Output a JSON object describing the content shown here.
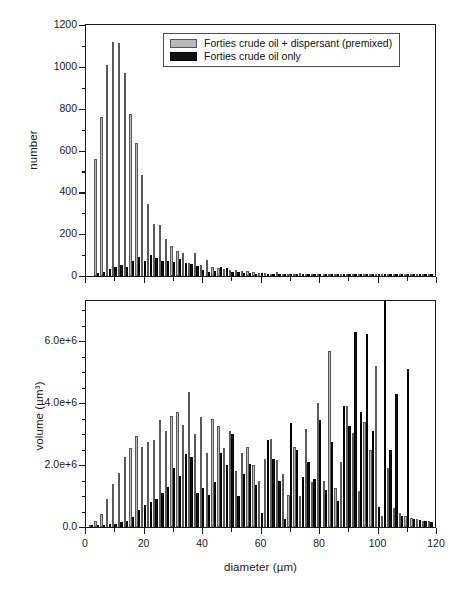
{
  "figure": {
    "background": "#ffffff",
    "series_colors": {
      "gray": "#b9b9b9",
      "black": "#111111"
    }
  },
  "legend": {
    "entries": [
      {
        "swatch": "gray",
        "label": "Forties crude oil + dispersant (premixed)"
      },
      {
        "swatch": "black",
        "label": "Forties crude oil only"
      }
    ]
  },
  "axes": {
    "x_label": "diameter (µm)",
    "x_ticks": [
      "0",
      "20",
      "40",
      "60",
      "80",
      "100",
      "120"
    ],
    "top_y_label": "number",
    "top_y_ticks": [
      "0",
      "200",
      "400",
      "600",
      "800",
      "1000",
      "1200"
    ],
    "bottom_y_label": "volume (µm³)",
    "bottom_y_ticks": [
      "0.0",
      "2.0e+6",
      "4.0e+6",
      "6.0e+6"
    ]
  },
  "chart_data": [
    {
      "type": "bar",
      "id": "number-panel",
      "title": "",
      "xlabel": "diameter (µm)",
      "ylabel": "number",
      "xlim": [
        0,
        120
      ],
      "ylim": [
        0,
        1200
      ],
      "grid": false,
      "legend_position": "top-right",
      "x": [
        2,
        4,
        6,
        8,
        10,
        12,
        14,
        16,
        18,
        20,
        22,
        24,
        26,
        28,
        30,
        32,
        34,
        36,
        38,
        40,
        42,
        44,
        46,
        48,
        50,
        52,
        54,
        56,
        58,
        60,
        62,
        64,
        66,
        68,
        70,
        72,
        74,
        76,
        78,
        80,
        82,
        84,
        86,
        88,
        90,
        92,
        94,
        96,
        98,
        100,
        102,
        104,
        106,
        108,
        110,
        112,
        114,
        116,
        118
      ],
      "series": [
        {
          "name": "Forties crude oil + dispersant (premixed)",
          "color": "#b9b9b9",
          "values": [
            0,
            560,
            760,
            1010,
            1120,
            1115,
            970,
            775,
            635,
            485,
            345,
            250,
            243,
            175,
            145,
            120,
            110,
            60,
            112,
            55,
            75,
            45,
            40,
            32,
            30,
            28,
            26,
            22,
            20,
            16,
            14,
            12,
            18,
            10,
            12,
            9,
            14,
            8,
            10,
            7,
            9,
            6,
            8,
            5,
            7,
            5,
            6,
            4,
            5,
            4,
            5,
            3,
            4,
            3,
            4,
            3,
            3,
            2,
            3
          ]
        },
        {
          "name": "Forties crude oil only",
          "color": "#111111",
          "values": [
            0,
            14,
            18,
            34,
            42,
            55,
            45,
            70,
            90,
            72,
            100,
            88,
            70,
            70,
            68,
            82,
            62,
            58,
            48,
            28,
            20,
            22,
            42,
            38,
            18,
            20,
            16,
            14,
            12,
            14,
            10,
            10,
            12,
            8,
            10,
            8,
            10,
            6,
            8,
            6,
            8,
            5,
            7,
            5,
            6,
            4,
            6,
            4,
            5,
            4,
            5,
            3,
            4,
            3,
            4,
            3,
            3,
            2,
            8
          ]
        }
      ]
    },
    {
      "type": "bar",
      "id": "volume-panel",
      "title": "",
      "xlabel": "diameter (µm)",
      "ylabel": "volume (µm³)",
      "xlim": [
        0,
        120
      ],
      "ylim": [
        0,
        7300000
      ],
      "grid": false,
      "x": [
        2,
        4,
        6,
        8,
        10,
        12,
        14,
        16,
        18,
        20,
        22,
        24,
        26,
        28,
        30,
        32,
        34,
        36,
        38,
        40,
        42,
        44,
        46,
        48,
        50,
        52,
        54,
        56,
        58,
        60,
        62,
        64,
        66,
        68,
        70,
        72,
        74,
        76,
        78,
        80,
        82,
        84,
        86,
        88,
        90,
        92,
        94,
        96,
        98,
        100,
        102,
        104,
        106,
        108,
        110,
        112,
        114,
        116,
        118
      ],
      "series": [
        {
          "name": "Forties crude oil + dispersant (premixed)",
          "color": "#b9b9b9",
          "values": [
            60000,
            180000,
            420000,
            900000,
            1400000,
            1750000,
            2250000,
            2550000,
            2950000,
            2600000,
            2750000,
            2800000,
            3450000,
            3100000,
            3600000,
            3700000,
            3300000,
            4350000,
            3000000,
            3550000,
            2400000,
            3500000,
            3250000,
            2550000,
            3100000,
            1800000,
            2400000,
            2600000,
            2000000,
            1500000,
            2200000,
            2850000,
            2150000,
            1700000,
            1050000,
            2600000,
            1000000,
            3150000,
            1450000,
            4000000,
            1500000,
            5700000,
            1250000,
            2100000,
            3900000,
            3050000,
            1150000,
            3400000,
            2500000,
            5200000,
            350000,
            1900000,
            600000,
            450000,
            350000,
            300000,
            250000,
            200000,
            180000
          ]
        },
        {
          "name": "Forties crude oil only",
          "color": "#111111",
          "values": [
            40000,
            60000,
            80000,
            90000,
            110000,
            150000,
            200000,
            320000,
            550000,
            700000,
            800000,
            900000,
            1100000,
            1300000,
            1900000,
            1650000,
            2350000,
            2250000,
            1100000,
            1250000,
            1050000,
            1450000,
            2400000,
            2000000,
            3000000,
            1000000,
            1700000,
            2050000,
            1350000,
            450000,
            2800000,
            2200000,
            1500000,
            250000,
            3350000,
            2500000,
            1600000,
            2100000,
            1550000,
            3450000,
            1200000,
            2750000,
            850000,
            3900000,
            3250000,
            6300000,
            3700000,
            6250000,
            3100000,
            650000,
            7300000,
            2500000,
            4300000,
            350000,
            5100000,
            260000,
            220000,
            190000,
            160000
          ]
        }
      ]
    }
  ],
  "caption": ""
}
